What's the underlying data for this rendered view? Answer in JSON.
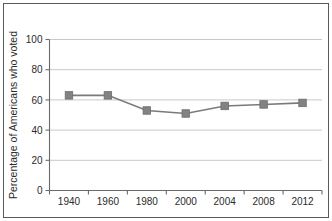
{
  "chart_data": {
    "type": "line",
    "title": "",
    "subtitle": "",
    "xlabel": "",
    "ylabel": "Percentage of Americans who voted",
    "categories": [
      "1940",
      "1960",
      "1980",
      "2000",
      "2004",
      "2008",
      "2012"
    ],
    "values": [
      63,
      63,
      53,
      51,
      56,
      57,
      58
    ],
    "series": [
      {
        "name": "Percentage of Americans who voted",
        "values": [
          63,
          63,
          53,
          51,
          56,
          57,
          58
        ]
      }
    ],
    "ylim": [
      0,
      100
    ],
    "yticks": [
      0,
      20,
      40,
      60,
      80,
      100
    ],
    "ytick_labels": [
      "0",
      "20",
      "40",
      "60",
      "80",
      "100"
    ],
    "xtick_labels": [
      "1940",
      "1960",
      "1980",
      "2000",
      "2004",
      "2008",
      "2012"
    ],
    "grid": "horizontal",
    "legend": "none",
    "marker": "square",
    "colors": {
      "line": "#7a7a7a",
      "marker": "#828282",
      "marker_edge": "#6d6d6d",
      "grid": "#c9c9c9",
      "axis": "#6a6a6a",
      "text": "#2b2b2b",
      "frame": "#5a5a5a",
      "background": "#ffffff"
    }
  }
}
